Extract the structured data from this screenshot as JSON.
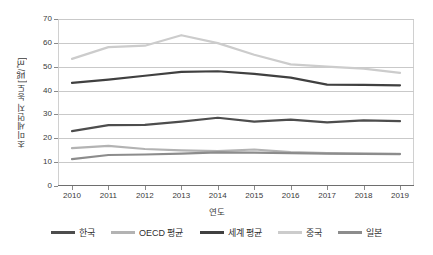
{
  "chart_data": {
    "type": "line",
    "title": "",
    "xlabel": "연도",
    "ylabel": "초미세먼지 농도[㎍/㎥]",
    "categories": [
      "2010",
      "2011",
      "2012",
      "2013",
      "2014",
      "2015",
      "2016",
      "2017",
      "2018",
      "2019"
    ],
    "ylim": [
      0,
      70
    ],
    "ytick_labels": [
      "0",
      "10",
      "20",
      "30",
      "40",
      "50",
      "60",
      "70"
    ],
    "ytick_values": [
      0,
      10,
      20,
      30,
      40,
      50,
      60,
      70
    ],
    "grid": true,
    "legend_position": "bottom",
    "series": [
      {
        "name": "한국",
        "color": "#4d4d4d",
        "values": [
          23.0,
          25.5,
          25.6,
          27.0,
          28.6,
          27.0,
          27.8,
          26.7,
          27.5,
          27.2
        ]
      },
      {
        "name": "OECD 평균",
        "color": "#b3b3b3",
        "values": [
          15.9,
          16.8,
          15.5,
          14.9,
          14.6,
          15.3,
          14.2,
          13.8,
          13.6,
          13.5
        ]
      },
      {
        "name": "세계 평균",
        "color": "#404040",
        "values": [
          43.2,
          44.6,
          46.2,
          47.8,
          48.1,
          47.0,
          45.4,
          42.5,
          42.4,
          42.2
        ]
      },
      {
        "name": "중국",
        "color": "#cccccc",
        "values": [
          53.3,
          58.2,
          58.8,
          63.2,
          59.9,
          55.0,
          51.0,
          50.0,
          49.2,
          47.4
        ]
      },
      {
        "name": "일본",
        "color": "#8c8c8c",
        "values": [
          11.3,
          13.0,
          13.2,
          13.6,
          14.1,
          14.0,
          13.8,
          13.6,
          13.5,
          13.4
        ]
      }
    ]
  },
  "axes": {
    "x_title": "연도",
    "y_title": "초미세먼지 농도[㎍/㎥]"
  },
  "legend": {
    "items": [
      {
        "label": "한국"
      },
      {
        "label": "OECD 평균"
      },
      {
        "label": "세계 평균"
      },
      {
        "label": "중국"
      },
      {
        "label": "일본"
      }
    ]
  }
}
